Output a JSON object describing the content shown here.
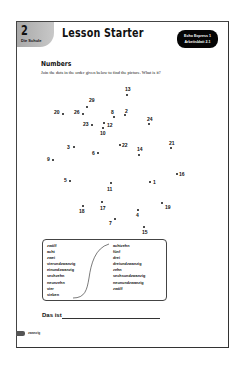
{
  "header": {
    "unit_number": "2",
    "unit_subtitle": "Die Schule",
    "title": "Lesson Starter",
    "badge_line1": "Echo Express 1",
    "badge_line2": "Arbeitsblatt 2.1"
  },
  "section": {
    "heading": "Numbers",
    "instruction": "Join the dots in the order given below to find the picture. What is it?"
  },
  "dots": [
    {
      "label": "13",
      "x": 126,
      "y": 94,
      "lx": 124,
      "ly": 86
    },
    {
      "label": "29",
      "x": 86,
      "y": 106,
      "lx": 88,
      "ly": 97
    },
    {
      "label": "20",
      "x": 62,
      "y": 113,
      "lx": 53,
      "ly": 109
    },
    {
      "label": "26",
      "x": 82,
      "y": 113,
      "lx": 73,
      "ly": 109
    },
    {
      "label": "8",
      "x": 113,
      "y": 116,
      "lx": 110,
      "ly": 109
    },
    {
      "label": "2",
      "x": 124,
      "y": 114,
      "lx": 124,
      "ly": 108
    },
    {
      "label": "24",
      "x": 148,
      "y": 123,
      "lx": 146,
      "ly": 116
    },
    {
      "label": "23",
      "x": 91,
      "y": 124,
      "lx": 82,
      "ly": 121
    },
    {
      "label": "12",
      "x": 103,
      "y": 122,
      "lx": 106,
      "ly": 122
    },
    {
      "label": "10",
      "x": 102,
      "y": 127,
      "lx": 99,
      "ly": 130
    },
    {
      "label": "22",
      "x": 119,
      "y": 144,
      "lx": 121,
      "ly": 142
    },
    {
      "label": "21",
      "x": 170,
      "y": 147,
      "lx": 168,
      "ly": 140
    },
    {
      "label": "3",
      "x": 73,
      "y": 146,
      "lx": 66,
      "ly": 144
    },
    {
      "label": "6",
      "x": 97,
      "y": 152,
      "lx": 91,
      "ly": 150
    },
    {
      "label": "14",
      "x": 138,
      "y": 154,
      "lx": 136,
      "ly": 146
    },
    {
      "label": "9",
      "x": 52,
      "y": 159,
      "lx": 46,
      "ly": 156
    },
    {
      "label": "16",
      "x": 176,
      "y": 173,
      "lx": 178,
      "ly": 171
    },
    {
      "label": "5",
      "x": 69,
      "y": 180,
      "lx": 63,
      "ly": 177
    },
    {
      "label": "1",
      "x": 149,
      "y": 181,
      "lx": 152,
      "ly": 179
    },
    {
      "label": "11",
      "x": 110,
      "y": 182,
      "lx": 106,
      "ly": 186
    },
    {
      "label": "18",
      "x": 82,
      "y": 205,
      "lx": 78,
      "ly": 208
    },
    {
      "label": "17",
      "x": 101,
      "y": 201,
      "lx": 99,
      "ly": 205
    },
    {
      "label": "19",
      "x": 161,
      "y": 202,
      "lx": 164,
      "ly": 204
    },
    {
      "label": "4",
      "x": 137,
      "y": 209,
      "lx": 135,
      "ly": 212
    },
    {
      "label": "7",
      "x": 114,
      "y": 218,
      "lx": 108,
      "ly": 220
    },
    {
      "label": "15",
      "x": 143,
      "y": 226,
      "lx": 141,
      "ly": 229
    }
  ],
  "words": {
    "left": [
      "zwölf",
      "acht",
      "zwei",
      "vierundzwanzig",
      "einundzwanzig",
      "sechzehn",
      "neunzehn",
      "vier",
      "sieben"
    ],
    "right": [
      "achtzehn",
      "fünf",
      "drei",
      "dreiundzwanzig",
      "zehn",
      "sechsundzwanzig",
      "neunundzwanzig",
      "zwölf"
    ]
  },
  "answer": {
    "label": "Das ist"
  },
  "footer": {
    "page_number_word": "zwanzig"
  }
}
